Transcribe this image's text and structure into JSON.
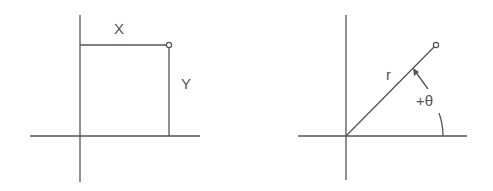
{
  "diagrams": [
    {
      "name": "cartesian-coordinates",
      "labels": {
        "x": "X",
        "y": "Y"
      },
      "origin": [
        80,
        136
      ],
      "point": [
        169,
        45
      ]
    },
    {
      "name": "polar-coordinates",
      "labels": {
        "r": "r",
        "theta": "+θ"
      },
      "origin": [
        346,
        136
      ],
      "point": [
        436,
        45
      ]
    }
  ],
  "colors": {
    "line": "#555555",
    "background": "#ffffff"
  }
}
